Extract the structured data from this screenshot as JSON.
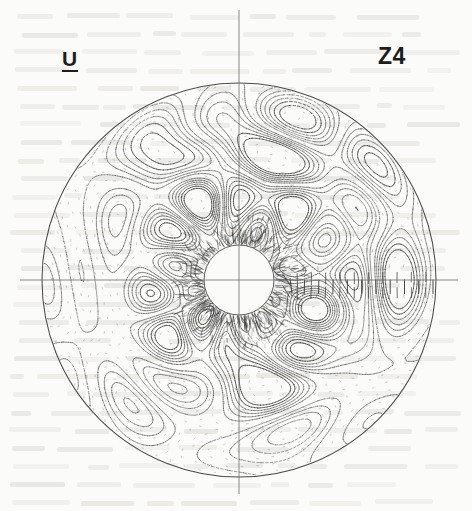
{
  "figure": {
    "title_left": "U",
    "title_right": "Z4",
    "background_color": "#fbfbfa",
    "ink_color": "#3a3a3a",
    "axis_color": "#6e6e6e"
  },
  "chart_data": {
    "type": "contour-vector-polar",
    "title": "U",
    "annotations": [
      "U",
      "Z4"
    ],
    "xlabel": "",
    "ylabel": "",
    "grid": false,
    "legend": null,
    "geometry": {
      "center_x": 239,
      "center_y": 280,
      "outer_radius": 197,
      "inner_radius": 35,
      "axis_h_x1": 20,
      "axis_h_x2": 458,
      "axis_v_y1": 10,
      "axis_v_y2": 494
    },
    "contour_style": {
      "solid": "positive levels",
      "dashed": "negative levels",
      "closed_loops": true
    },
    "vector_field": {
      "glyph": "line-tick",
      "max_magnitude_region": "right horizontal axis and inner-circle rim",
      "radial_samples": 22,
      "azimuthal_samples": 72
    },
    "seed": 20240517
  },
  "overlay": {
    "show_through_text": true,
    "show_through_note": "faint illegible text bleeding through from reverse side of page"
  }
}
